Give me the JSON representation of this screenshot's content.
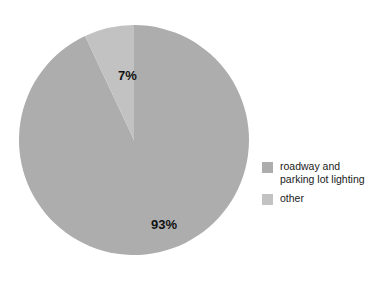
{
  "chart_data": {
    "type": "pie",
    "title": "",
    "subtitle": "",
    "xlabel": "",
    "ylabel": "",
    "categories": [
      "roadway and parking lot lighting",
      "other"
    ],
    "values": [
      93,
      7
    ],
    "value_unit": "%",
    "data_labels": [
      "93%",
      "7%"
    ],
    "colors": [
      "#adadad",
      "#c2c2c2"
    ],
    "start_angle_deg": 0,
    "direction": "counterclockwise",
    "legend": {
      "position": "right",
      "entries": [
        {
          "label": "roadway and\nparking lot lighting",
          "color": "#adadad"
        },
        {
          "label": "other",
          "color": "#c2c2c2"
        }
      ]
    },
    "grid": false,
    "background_color": "#ffffff"
  },
  "figure": {
    "background": "#ffffff",
    "slice_labels": {
      "other": "7%",
      "roadway": "93%"
    }
  }
}
